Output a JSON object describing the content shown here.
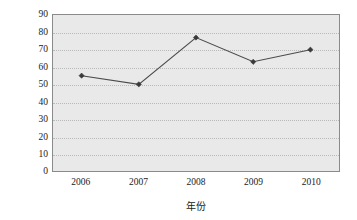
{
  "chart_data": {
    "type": "line",
    "title": "",
    "xlabel": "年份",
    "ylabel": "平均支助资金(万元)",
    "categories": [
      "2006",
      "2007",
      "2008",
      "2009",
      "2010"
    ],
    "values": [
      55,
      50,
      77,
      63,
      70
    ],
    "series": [
      {
        "name": "平均支助资金",
        "values": [
          55,
          50,
          77,
          63,
          70
        ]
      }
    ],
    "ylim": [
      0,
      90
    ],
    "ytick_step": 10,
    "yticks": [
      "90",
      "80",
      "70",
      "60",
      "50",
      "40",
      "30",
      "20",
      "10",
      "0"
    ],
    "grid": true,
    "grid_axis": "y",
    "legend": "none",
    "marker": "diamond",
    "colors": {
      "line": "#4a4a4a",
      "marker": "#3a3a3a",
      "plot_background": "#e9e9e9",
      "grid": "#b9b9b9",
      "border": "#8a8a8a",
      "text": "#1b1b1b",
      "page_background": "#ffffff"
    }
  }
}
